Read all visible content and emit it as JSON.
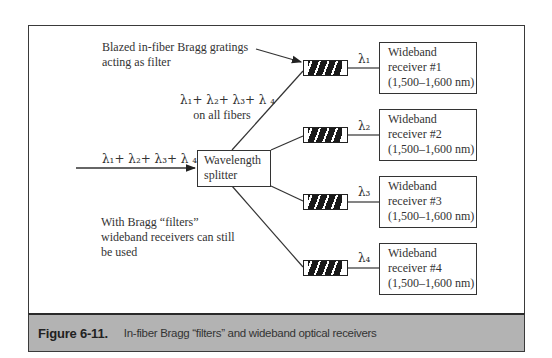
{
  "figure": {
    "number": "Figure 6-11.",
    "caption": "In-fiber Bragg “filters” and wideband optical receivers"
  },
  "annotations": {
    "gratings_label_line1": "Blazed in-fiber Bragg gratings",
    "gratings_label_line2": "acting as filter",
    "all_fibers_sum": "λ₁+ λ₂+ λ₃+ λ ₄",
    "all_fibers_line2": "on all fibers",
    "input_sum": "λ₁+ λ₂+ λ₃+ λ ₄",
    "bragg_note_line1": "With Bragg “filters”",
    "bragg_note_line2": "wideband receivers can still",
    "bragg_note_line3": "be used"
  },
  "splitter": {
    "line1": "Wavelength",
    "line2": "splitter"
  },
  "channels": [
    {
      "lambda": "λ₁",
      "receiver_line1": "Wideband",
      "receiver_line2": "receiver #1",
      "receiver_line3": "(1,500–1,600 nm)"
    },
    {
      "lambda": "λ₂",
      "receiver_line1": "Wideband",
      "receiver_line2": "receiver #2",
      "receiver_line3": "(1,500–1,600 nm)"
    },
    {
      "lambda": "λ₃",
      "receiver_line1": "Wideband",
      "receiver_line2": "receiver #3",
      "receiver_line3": "(1,500–1,600 nm)"
    },
    {
      "lambda": "λ₄",
      "receiver_line1": "Wideband",
      "receiver_line2": "receiver #4",
      "receiver_line3": "(1,500–1,600 nm)"
    }
  ],
  "colors": {
    "caption_bar": "#b3b3b3",
    "line": "#333333",
    "grating_fill": "#1a1a1a"
  }
}
